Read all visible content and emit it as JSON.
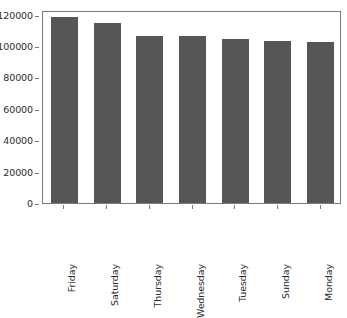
{
  "chart_data": {
    "type": "bar",
    "title": "",
    "subtitle": "",
    "xlabel": "",
    "ylabel": "",
    "categories": [
      "Friday",
      "Saturday",
      "Thursday",
      "Wednesday",
      "Tuesday",
      "Sunday",
      "Monday"
    ],
    "values": [
      118500,
      114500,
      106500,
      106500,
      104500,
      103000,
      102500
    ],
    "series": [
      {
        "name": "count",
        "values": [
          118500,
          114500,
          106500,
          106500,
          104500,
          103000,
          102500
        ]
      }
    ],
    "ylim": [
      0,
      123000
    ],
    "yticks": [
      0,
      20000,
      40000,
      60000,
      80000,
      100000,
      120000
    ],
    "ytick_labels": [
      "0",
      "20000",
      "40000",
      "60000",
      "80000",
      "100000",
      "120000"
    ],
    "xtick_labels": [
      "Friday",
      "Saturday",
      "Thursday",
      "Wednesday",
      "Tuesday",
      "Sunday",
      "Monday"
    ],
    "xtick_rotation": 90,
    "grid": false,
    "legend": null,
    "legend_position": "none",
    "bar_color": "#565656",
    "axes_color": "#7a7a7a",
    "text_color": "#2b2b2b",
    "background_color": "#ffffff",
    "annotations": []
  }
}
